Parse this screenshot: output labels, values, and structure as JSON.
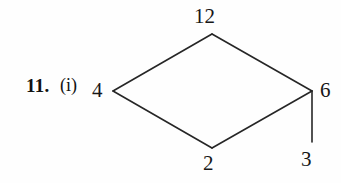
{
  "problem": {
    "number_label": "11.",
    "part_label": "(i)"
  },
  "diagram": {
    "type": "number-diamond",
    "stroke_color": "#262626",
    "background_color": "#fefefe",
    "nodes": [
      {
        "id": "left",
        "value": "4",
        "x": 113,
        "y": 91
      },
      {
        "id": "top",
        "value": "12",
        "x": 212,
        "y": 34
      },
      {
        "id": "right",
        "value": "6",
        "x": 312,
        "y": 91
      },
      {
        "id": "bottom",
        "value": "2",
        "x": 212,
        "y": 148
      },
      {
        "id": "pendant",
        "value": "3",
        "x": 312,
        "y": 142
      }
    ],
    "edges": [
      {
        "from": "left",
        "to": "top"
      },
      {
        "from": "top",
        "to": "right"
      },
      {
        "from": "left",
        "to": "bottom"
      },
      {
        "from": "bottom",
        "to": "right"
      },
      {
        "from": "right",
        "to": "pendant"
      }
    ],
    "labels": {
      "left": "4",
      "top": "12",
      "right": "6",
      "bottom": "2",
      "pendant": "3"
    }
  }
}
